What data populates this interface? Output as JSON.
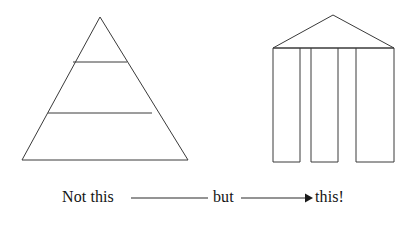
{
  "figure": {
    "title": "Not this but this!",
    "background_color": "#ffffff",
    "stroke_color": "#3a3a3a",
    "text_color": "#141414",
    "left_shape": {
      "name": "pyramid",
      "description": "Triangle divided into three horizontal tiers",
      "apex": {
        "x": 100,
        "y": 17
      },
      "base_left": {
        "x": 22,
        "y": 160
      },
      "base_right": {
        "x": 188,
        "y": 160
      },
      "divider_y": [
        62,
        113
      ],
      "tier_count": 3
    },
    "right_shape": {
      "name": "temple",
      "description": "Gabled roof supported by three free-standing columns",
      "roof_peak": {
        "x": 333,
        "y": 15
      },
      "lintel_left": {
        "x": 273,
        "y": 48
      },
      "lintel_right": {
        "x": 394,
        "y": 48
      },
      "column_bottom_y": 162,
      "column_count": 3,
      "columns": [
        {
          "left": 273,
          "right": 300
        },
        {
          "left": 311,
          "right": 338
        },
        {
          "left": 356,
          "right": 394
        }
      ]
    },
    "caption": {
      "not_this": "Not this",
      "but": "but",
      "this": "this!",
      "connector_line": {
        "x1": 131,
        "y1": 198,
        "x2": 208,
        "y2": 198
      },
      "arrow_line": {
        "x1": 241,
        "y1": 198,
        "x2": 308,
        "y2": 198
      },
      "arrow_head": {
        "x": 312,
        "y": 198,
        "direction": "right"
      }
    }
  }
}
